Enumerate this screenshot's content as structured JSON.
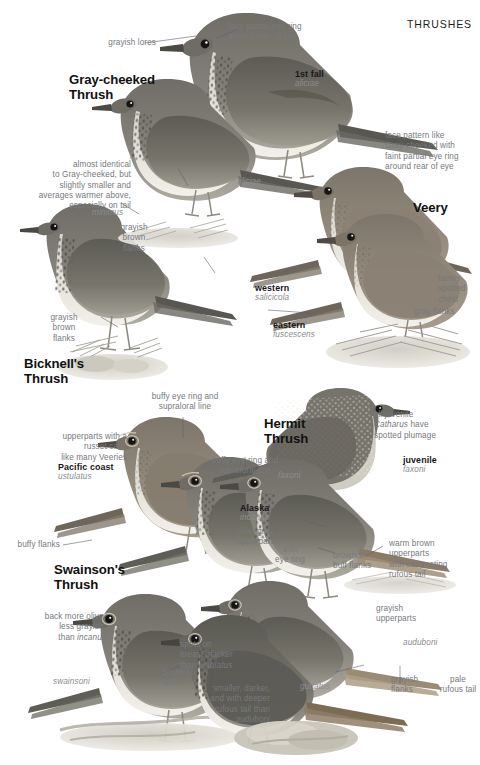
{
  "page": {
    "header": "THRUSHES",
    "plate_subject": "Catharus thrushes comparison plate"
  },
  "species": [
    {
      "id": "gray-cheeked",
      "name": "Gray-cheeked\nThrush"
    },
    {
      "id": "bicknells",
      "name": "Bicknell's\nThrush"
    },
    {
      "id": "veery",
      "name": "Veery"
    },
    {
      "id": "hermit",
      "name": "Hermit\nThrush"
    },
    {
      "id": "swainsons",
      "name": "Swainson's\nThrush"
    }
  ],
  "groups": [
    {
      "id": "1st-fall",
      "label": "1st fall",
      "sci": "aliciae"
    },
    {
      "id": "gc-adult",
      "label": "",
      "sci": "aliciae"
    },
    {
      "id": "bicknell-ssp",
      "label": "",
      "sci": "minimus"
    },
    {
      "id": "veery-western",
      "label": "western",
      "sci": "salicicola"
    },
    {
      "id": "veery-eastern",
      "label": "eastern",
      "sci": "fuscescens"
    },
    {
      "id": "hermit-juv",
      "label": "juvenile",
      "sci": "faxoni"
    },
    {
      "id": "hermit-faxoni",
      "label": "",
      "sci": "faxoni"
    },
    {
      "id": "hermit-aud",
      "label": "",
      "sci": "auduboni"
    },
    {
      "id": "hermit-gutt",
      "label": "",
      "sci": "guttatus"
    },
    {
      "id": "sw-pacific",
      "label": "Pacific coast",
      "sci": "ustulatus"
    },
    {
      "id": "sw-alaska",
      "label": "Alaska",
      "sci": "incanus"
    },
    {
      "id": "sw-swainsoni",
      "label": "",
      "sci": "swainsoni"
    }
  ],
  "annotations": [
    {
      "id": "grayish-lores",
      "text": "grayish lores"
    },
    {
      "id": "faint-eye-ring-top",
      "text": "faint partial eye ring\naround rear of eye"
    },
    {
      "id": "almost-identical",
      "text": "almost identical\nto Gray-cheeked, but\nslightly smaller and\naverages warmer above,\nespecially on tail"
    },
    {
      "id": "grayish-brown-flanks-1",
      "text": "grayish\nbrown\nflanks"
    },
    {
      "id": "grayish-brown-flanks-2",
      "text": "grayish\nbrown\nflanks"
    },
    {
      "id": "face-pattern-veery",
      "text": "face pattern like\nGray-cheeked with\nfaint partial eye ring\naround rear of eye"
    },
    {
      "id": "faintly-spotted-chest",
      "text": "faintly\nspotted\nchest"
    },
    {
      "id": "gray-flanks",
      "text": "gray flanks"
    },
    {
      "id": "buffy-eye-ring-1",
      "text": "buffy eye ring and\nsupraloral line"
    },
    {
      "id": "buffy-eye-ring-2",
      "text": "buffy eye ring and\nsupraloral line"
    },
    {
      "id": "russet-cast",
      "text": "upperparts with a\nrusset cast,\nlike many Veeries"
    },
    {
      "id": "buffy-flanks",
      "text": "buffy flanks"
    },
    {
      "id": "olive-gray-upperparts",
      "text": "olive-gray\nupperparts"
    },
    {
      "id": "all-juvenile",
      "text": "all juvenile\nCatharus have\nspotted plumage",
      "italic_part": "Catharus"
    },
    {
      "id": "thin-eye-ring",
      "text": "thin\neye ring"
    },
    {
      "id": "brownish-buff-flanks",
      "text": "brownish\nbuff flanks"
    },
    {
      "id": "warm-brown-upperparts",
      "text": "warm brown\nupperparts\nwith contrasting\nrufous tail"
    },
    {
      "id": "back-more-olive",
      "text": "back more olive,\nless grayish,\nthan incanus",
      "italic_part": "incanus"
    },
    {
      "id": "spots-on-breast",
      "text": "spots on\nbreast blacker\nthan ustulatus",
      "italic_part": "ustulatus"
    },
    {
      "id": "brownish-flanks",
      "text": "brownish\nflanks"
    },
    {
      "id": "grayish-upperparts",
      "text": "grayish\nupperparts"
    },
    {
      "id": "grayish-flanks",
      "text": "grayish\nflanks"
    },
    {
      "id": "pale-rufous-tail",
      "text": "pale\nrufous tail"
    },
    {
      "id": "smaller-darker",
      "text": "smaller, darker,\nand with deeper\nrufous tail than\nauduboni",
      "italic_part": "auduboni"
    }
  ],
  "colors": {
    "page_background": "#ffffff",
    "heading_text": "#1d1d1d",
    "species_text": "#111111",
    "annotation_text": "#76797d",
    "scientific_text": "#8a8d90",
    "leader_line": "#5f6266",
    "bird_body_dark": "#5b5a55",
    "bird_body_mid": "#8a887f",
    "bird_belly": "#e2ded5",
    "bird_spot": "#3a3936",
    "ground": "#bcb9ae",
    "foliage": "#a9a89d"
  }
}
